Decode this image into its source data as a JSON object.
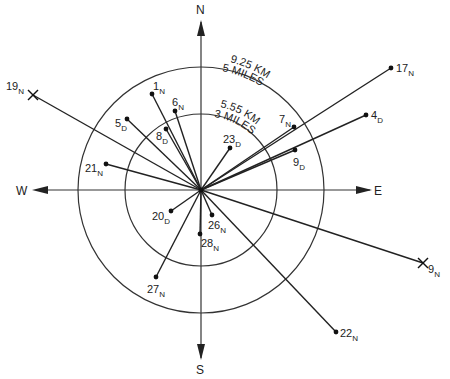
{
  "compass": {
    "north": "N",
    "south": "S",
    "east": "E",
    "west": "W"
  },
  "rings": [
    {
      "id": "inner",
      "radius_px": 76,
      "label_km": "5.55 KM",
      "label_miles": "3 MILES"
    },
    {
      "id": "outer",
      "radius_px": 123,
      "label_km": "9.25 KM",
      "label_miles": "5 MILES"
    }
  ],
  "points": [
    {
      "num": "1",
      "sub": "N",
      "x": 152,
      "y": 94,
      "marker": "dot",
      "lx": 153,
      "ly": 90
    },
    {
      "num": "6",
      "sub": "N",
      "x": 175,
      "y": 111,
      "marker": "dot",
      "lx": 172,
      "ly": 106
    },
    {
      "num": "5",
      "sub": "D",
      "x": 127,
      "y": 119,
      "marker": "dot",
      "lx": 115,
      "ly": 127
    },
    {
      "num": "8",
      "sub": "D",
      "x": 166,
      "y": 129,
      "marker": "dot",
      "lx": 156,
      "ly": 140
    },
    {
      "num": "19",
      "sub": "N",
      "x": 33,
      "y": 95,
      "marker": "cross",
      "lx": 6,
      "ly": 90
    },
    {
      "num": "21",
      "sub": "N",
      "x": 106,
      "y": 164,
      "marker": "dot",
      "lx": 85,
      "ly": 172
    },
    {
      "num": "23",
      "sub": "D",
      "x": 230,
      "y": 148,
      "marker": "dot",
      "lx": 223,
      "ly": 143
    },
    {
      "num": "7",
      "sub": "N",
      "x": 294,
      "y": 127,
      "marker": "dot",
      "lx": 279,
      "ly": 123
    },
    {
      "num": "9",
      "sub": "D",
      "x": 295,
      "y": 150,
      "marker": "dot",
      "lx": 293,
      "ly": 166
    },
    {
      "num": "17",
      "sub": "N",
      "x": 391,
      "y": 68,
      "marker": "dot",
      "lx": 396,
      "ly": 72
    },
    {
      "num": "4",
      "sub": "D",
      "x": 366,
      "y": 115,
      "marker": "dot",
      "lx": 371,
      "ly": 119
    },
    {
      "num": "20",
      "sub": "D",
      "x": 171,
      "y": 211,
      "marker": "dot",
      "lx": 152,
      "ly": 220
    },
    {
      "num": "26",
      "sub": "N",
      "x": 212,
      "y": 215,
      "marker": "dot",
      "lx": 208,
      "ly": 229
    },
    {
      "num": "28",
      "sub": "N",
      "x": 200,
      "y": 234,
      "marker": "dot",
      "lx": 201,
      "ly": 247
    },
    {
      "num": "27",
      "sub": "N",
      "x": 156,
      "y": 277,
      "marker": "dot",
      "lx": 147,
      "ly": 293
    },
    {
      "num": "22",
      "sub": "N",
      "x": 336,
      "y": 332,
      "marker": "dot",
      "lx": 340,
      "ly": 337
    },
    {
      "num": "9",
      "sub": "N",
      "x": 423,
      "y": 263,
      "marker": "cross",
      "lx": 428,
      "ly": 273
    }
  ]
}
